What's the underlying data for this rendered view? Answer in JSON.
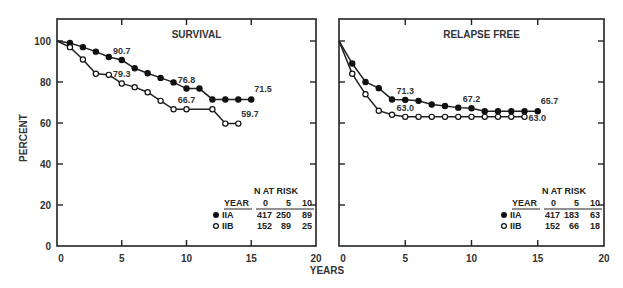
{
  "figure": {
    "ylabel": "PERCENT",
    "xlabel": "YEARS"
  },
  "chart_data": [
    {
      "type": "line",
      "title": "SURVIVAL",
      "xlabel": "YEARS",
      "ylabel": "PERCENT",
      "xlim": [
        0,
        20
      ],
      "ylim": [
        0,
        100
      ],
      "xticks": [
        0,
        5,
        10,
        15,
        20
      ],
      "yticks": [
        0,
        20,
        40,
        60,
        80,
        100
      ],
      "grid": false,
      "series": [
        {
          "name": "IIA",
          "marker": "filled-circle",
          "x": [
            0,
            1,
            2,
            3,
            4,
            5,
            6,
            7,
            8,
            9,
            10,
            11,
            12,
            13,
            14,
            15
          ],
          "values": [
            100,
            99.0,
            97.0,
            94.8,
            92.2,
            90.7,
            86.7,
            84.3,
            82.0,
            79.8,
            76.8,
            76.8,
            71.5,
            71.5,
            71.5,
            71.5
          ]
        },
        {
          "name": "IIB",
          "marker": "open-circle",
          "x": [
            0,
            1,
            2,
            3,
            4,
            5,
            6,
            7,
            8,
            9,
            10,
            12,
            13,
            14
          ],
          "values": [
            100,
            97.0,
            91.0,
            84.0,
            83.5,
            79.3,
            77.5,
            75.0,
            70.8,
            66.7,
            66.7,
            66.7,
            59.7,
            59.7
          ]
        }
      ],
      "annotations": [
        {
          "series": "IIA",
          "x": 5,
          "text": "90.7"
        },
        {
          "series": "IIA",
          "x": 10,
          "text": "76.8"
        },
        {
          "series": "IIA",
          "x": 15,
          "text": "71.5"
        },
        {
          "series": "IIB",
          "x": 5,
          "text": "79.3"
        },
        {
          "series": "IIB",
          "x": 10,
          "text": "66.7"
        },
        {
          "series": "IIB",
          "x": 14,
          "text": "59.7"
        }
      ],
      "legend": {
        "title": "N AT RISK",
        "header": [
          "YEAR",
          "0",
          "5",
          "10"
        ],
        "rows": [
          {
            "marker": "filled-circle",
            "label": "IIA",
            "values": [
              "417",
              "250",
              "89"
            ]
          },
          {
            "marker": "open-circle",
            "label": "IIB",
            "values": [
              "152",
              "89",
              "25"
            ]
          }
        ],
        "position": "lower right"
      }
    },
    {
      "type": "line",
      "title": "RELAPSE FREE",
      "xlabel": "YEARS",
      "ylabel": "PERCENT",
      "xlim": [
        0,
        20
      ],
      "ylim": [
        0,
        100
      ],
      "xticks": [
        0,
        5,
        10,
        15,
        20
      ],
      "yticks": [
        0,
        20,
        40,
        60,
        80,
        100
      ],
      "grid": false,
      "series": [
        {
          "name": "IIA",
          "marker": "filled-circle",
          "x": [
            0,
            1,
            2,
            3,
            4,
            5,
            6,
            7,
            8,
            9,
            10,
            11,
            12,
            13,
            14,
            15
          ],
          "values": [
            100,
            89.0,
            80.0,
            77.0,
            71.5,
            71.3,
            70.8,
            69.0,
            68.3,
            67.5,
            67.2,
            65.7,
            65.7,
            65.7,
            65.7,
            65.7
          ]
        },
        {
          "name": "IIB",
          "marker": "open-circle",
          "x": [
            0,
            1,
            2,
            3,
            4,
            5,
            6,
            7,
            8,
            9,
            10,
            11,
            12,
            13,
            14
          ],
          "values": [
            100,
            84.0,
            74.0,
            66.0,
            64.0,
            63.0,
            63.0,
            63.0,
            63.0,
            63.0,
            63.0,
            63.0,
            63.0,
            63.0,
            63.0
          ]
        }
      ],
      "annotations": [
        {
          "series": "IIA",
          "x": 5,
          "text": "71.3"
        },
        {
          "series": "IIA",
          "x": 10,
          "text": "67.2"
        },
        {
          "series": "IIA",
          "x": 15,
          "text": "65.7"
        },
        {
          "series": "IIB",
          "x": 5,
          "text": "63.0"
        },
        {
          "series": "IIB",
          "x": 14,
          "text": "63.0"
        }
      ],
      "legend": {
        "title": "N AT RISK",
        "header": [
          "YEAR",
          "0",
          "5",
          "10"
        ],
        "rows": [
          {
            "marker": "filled-circle",
            "label": "IIA",
            "values": [
              "417",
              "183",
              "63"
            ]
          },
          {
            "marker": "open-circle",
            "label": "IIB",
            "values": [
              "152",
              "66",
              "18"
            ]
          }
        ],
        "position": "lower right"
      }
    }
  ]
}
